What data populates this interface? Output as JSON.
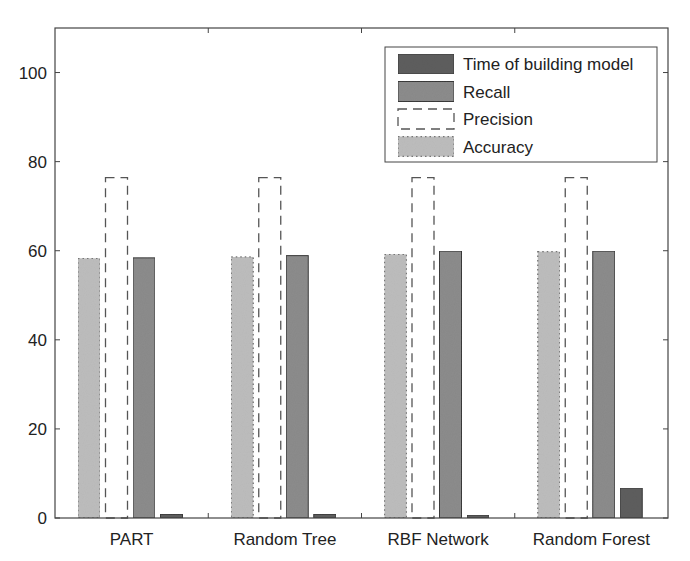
{
  "chart_data": {
    "type": "bar",
    "title": "",
    "xlabel": "",
    "ylabel": "",
    "categories": [
      "PART",
      "Random Tree",
      "RBF Network",
      "Random Forest"
    ],
    "series": [
      {
        "name": "Accuracy",
        "values": [
          58.3,
          58.6,
          59.2,
          59.8
        ],
        "color": "#bdbdbd",
        "style": "dotted-outline"
      },
      {
        "name": "Precision",
        "values": [
          76.4,
          76.4,
          76.4,
          76.4
        ],
        "color": "#ffffff",
        "style": "dashed-outline"
      },
      {
        "name": "Recall",
        "values": [
          58.4,
          58.9,
          59.9,
          59.9
        ],
        "color": "#8c8c8c",
        "style": "solid"
      },
      {
        "name": "Time of building model",
        "values": [
          0.8,
          0.8,
          0.6,
          6.7
        ],
        "color": "#5e5e5e",
        "style": "solid"
      }
    ],
    "ylim": [
      0,
      110
    ],
    "yticks": [
      0,
      20,
      40,
      60,
      80,
      100
    ],
    "grid": false,
    "legend": {
      "position": "upper right",
      "entries": [
        "Time of building model",
        "Recall",
        "Precision",
        "Accuracy"
      ]
    }
  }
}
